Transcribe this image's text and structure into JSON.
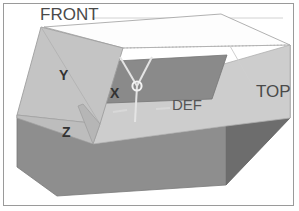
{
  "figure": {
    "background_color": "#ffffff",
    "border_color": "#9a9a9a"
  },
  "labels": {
    "front": "FRONT",
    "top": "TOP",
    "def": "DEF",
    "axis_x": "X",
    "axis_y": "Y",
    "axis_z": "Z",
    "ghost_left": "",
    "ghost_right": ""
  },
  "colors": {
    "face_top": "#fcfcfc",
    "face_lid": "#c3c3c3",
    "face_lid_dark": "#b4b4b4",
    "face_front_left": "#8e8e8e",
    "face_right": "#6d6d6d",
    "face_inner_floor": "#cfcfcf",
    "face_inner_back": "#8a8a8a",
    "face_inner_side": "#7c7c7c",
    "outline": "#8a8a8a",
    "leader_line": "#b8b8b8",
    "axis_line": "#e8e8e8",
    "origin_marker": "#f2f2f2",
    "text_dark": "#333333",
    "text_gray": "#4a4a4a",
    "text_faint": "#8e8e8e"
  },
  "geometry": {
    "box_kind": "open-top carton with folded-back lid",
    "origin_marker_shape": "circle",
    "axes_shown": [
      "X",
      "Y",
      "Z"
    ],
    "leader_lines": [
      {
        "from": "FRONT",
        "to": "lid-face"
      },
      {
        "from": "TOP",
        "to": "right-face"
      }
    ]
  }
}
